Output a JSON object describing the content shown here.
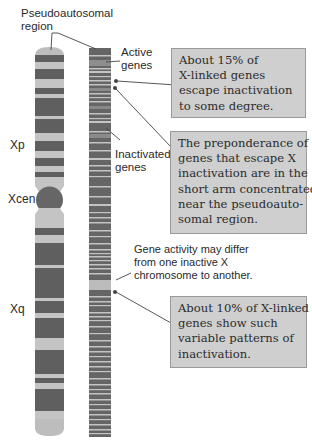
{
  "diagram": {
    "colors": {
      "dark_band": "#5f5f5f",
      "light_band": "#c4c4c4",
      "centromere": "#666666",
      "telomere": "#bdbdbd",
      "callout_fill": "#cfcfcf",
      "callout_border": "#9a9a9a",
      "leader_line": "#444444"
    },
    "labels": {
      "pseudoautosomal": [
        "Pseudoautosomal",
        "region"
      ],
      "active_genes": [
        "Active",
        "genes"
      ],
      "inactivated_genes": [
        "Inactivated",
        "genes"
      ],
      "xp": "Xp",
      "xcen": "Xcen",
      "xq": "Xq",
      "variable_note": [
        "Gene activity may differ",
        "from one inactive X",
        "chromosome to another."
      ]
    },
    "callouts": [
      {
        "id": "escape-15",
        "lines": [
          "About 15% of",
          "X-linked genes",
          "escape inactivation",
          "to some degree."
        ]
      },
      {
        "id": "preponderance",
        "lines": [
          "The preponderance of",
          "genes that escape X",
          "inactivation are in the",
          "short arm concentrated",
          "near the pseudoauto-",
          "somal region."
        ]
      },
      {
        "id": "variable-10",
        "lines": [
          "About 10% of X-linked",
          "genes show such",
          "variable patterns of",
          "inactivation."
        ]
      }
    ],
    "chromosome_bands": [
      "L",
      "D",
      "L",
      "D",
      "L",
      "D",
      "L",
      "D",
      "D",
      "L",
      "D",
      "L",
      "D",
      "CEN",
      "L",
      "D",
      "L",
      "D",
      "D",
      "L",
      "D",
      "L",
      "D",
      "L",
      "D",
      "L",
      "L"
    ],
    "gene_map_states": "inactive-dark / active-light alternating stripes"
  }
}
